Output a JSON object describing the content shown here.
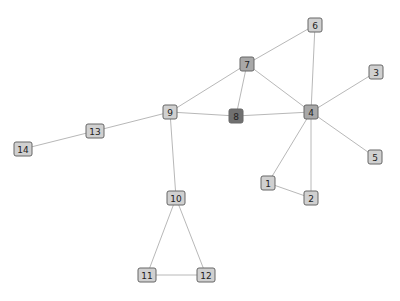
{
  "graph": {
    "type": "network",
    "node_size": 14,
    "colors": {
      "edge": "#b8b8b8",
      "node_default": "#d0d0d0",
      "node_medium": "#a8a8a8",
      "node_dark": "#707070",
      "node_border": "#666666"
    },
    "nodes": [
      {
        "id": "1",
        "label": "1",
        "x": 268,
        "y": 183,
        "shade": "node_default"
      },
      {
        "id": "2",
        "label": "2",
        "x": 311,
        "y": 198,
        "shade": "node_default"
      },
      {
        "id": "3",
        "label": "3",
        "x": 376,
        "y": 72,
        "shade": "node_default"
      },
      {
        "id": "4",
        "label": "4",
        "x": 311,
        "y": 112,
        "shade": "node_medium"
      },
      {
        "id": "5",
        "label": "5",
        "x": 375,
        "y": 157,
        "shade": "node_default"
      },
      {
        "id": "6",
        "label": "6",
        "x": 315,
        "y": 25,
        "shade": "node_default"
      },
      {
        "id": "7",
        "label": "7",
        "x": 247,
        "y": 64,
        "shade": "node_medium"
      },
      {
        "id": "8",
        "label": "8",
        "x": 236,
        "y": 116,
        "shade": "node_dark"
      },
      {
        "id": "9",
        "label": "9",
        "x": 170,
        "y": 112,
        "shade": "node_default"
      },
      {
        "id": "10",
        "label": "10",
        "x": 176,
        "y": 198,
        "shade": "node_default"
      },
      {
        "id": "11",
        "label": "11",
        "x": 147,
        "y": 275,
        "shade": "node_default"
      },
      {
        "id": "12",
        "label": "12",
        "x": 206,
        "y": 275,
        "shade": "node_default"
      },
      {
        "id": "13",
        "label": "13",
        "x": 95,
        "y": 131,
        "shade": "node_default"
      },
      {
        "id": "14",
        "label": "14",
        "x": 23,
        "y": 149,
        "shade": "node_default"
      }
    ],
    "edges": [
      [
        "6",
        "7"
      ],
      [
        "6",
        "4"
      ],
      [
        "7",
        "9"
      ],
      [
        "7",
        "8"
      ],
      [
        "7",
        "4"
      ],
      [
        "9",
        "8"
      ],
      [
        "8",
        "4"
      ],
      [
        "4",
        "3"
      ],
      [
        "4",
        "5"
      ],
      [
        "4",
        "1"
      ],
      [
        "4",
        "2"
      ],
      [
        "1",
        "2"
      ],
      [
        "9",
        "13"
      ],
      [
        "13",
        "14"
      ],
      [
        "9",
        "10"
      ],
      [
        "10",
        "11"
      ],
      [
        "10",
        "12"
      ],
      [
        "11",
        "12"
      ]
    ]
  }
}
